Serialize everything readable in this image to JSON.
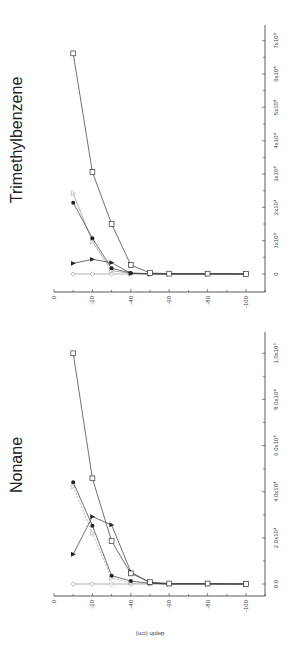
{
  "figure": {
    "orientation": "rotated 90 degrees counter-clockwise",
    "colors": {
      "axis": "#333333",
      "line_dark": "#333333",
      "line_gray": "#aaaaaa",
      "marker_fill": "#222222",
      "background": "#ffffff"
    }
  },
  "chart_data": [
    {
      "type": "line",
      "title": "Trimethylbenzene",
      "xlabel": "depth (cm)",
      "ylabel": "",
      "x": [
        -10,
        -20,
        -30,
        -40,
        -50,
        -60,
        -80,
        -100
      ],
      "xlim": [
        0,
        -110
      ],
      "ylim": [
        -5000,
        75000
      ],
      "x_ticks": [
        "0",
        "-20",
        "-40",
        "-60",
        "-80",
        "-100"
      ],
      "y_ticks": [
        "0",
        "1x10⁴",
        "2x10⁴",
        "3x10⁴",
        "4x10⁴",
        "5x10⁴",
        "6x10⁴",
        "7x10⁴"
      ],
      "y_tick_values": [
        0,
        10000,
        20000,
        30000,
        40000,
        50000,
        60000,
        70000
      ],
      "grid": false,
      "series": [
        {
          "name": "open square",
          "marker": "square-open",
          "style": "solid-dark",
          "values": [
            66200,
            30600,
            15000,
            2700,
            300,
            100,
            100,
            0
          ]
        },
        {
          "name": "filled circle",
          "marker": "circle-filled",
          "style": "solid-dark",
          "values": [
            21400,
            10700,
            1700,
            300,
            100,
            0,
            0,
            0
          ]
        },
        {
          "name": "open triangle",
          "marker": "triangle-open",
          "style": "solid-gray",
          "values": [
            24200,
            9700,
            1000,
            200,
            0,
            0,
            0,
            0
          ]
        },
        {
          "name": "filled triangle",
          "marker": "triangle-filled",
          "style": "solid-dark",
          "values": [
            3200,
            4400,
            3400,
            200,
            0,
            0,
            0,
            0
          ]
        },
        {
          "name": "open diamond",
          "marker": "diamond-open",
          "style": "solid-gray",
          "values": [
            0,
            0,
            0,
            0,
            0,
            0,
            0,
            0
          ]
        }
      ]
    },
    {
      "type": "line",
      "title": "Nonane",
      "xlabel": "depth (cm)",
      "ylabel": "",
      "x": [
        -10,
        -20,
        -30,
        -40,
        -50,
        -60,
        -80,
        -100
      ],
      "xlim": [
        0,
        -110
      ],
      "ylim": [
        -5000,
        108000
      ],
      "x_ticks": [
        "0",
        "-20",
        "-40",
        "-60",
        "-80",
        "-100"
      ],
      "y_ticks": [
        "0.0",
        "2.0x10⁴",
        "4.0x10⁴",
        "6.0x10⁴",
        "8.0x10⁴",
        "1.0x10⁵"
      ],
      "y_tick_values": [
        0,
        20000,
        40000,
        60000,
        80000,
        100000
      ],
      "grid": false,
      "series": [
        {
          "name": "open square",
          "marker": "square-open",
          "style": "solid-dark",
          "values": [
            100000,
            45800,
            18600,
            4600,
            800,
            200,
            200,
            0
          ]
        },
        {
          "name": "filled circle",
          "marker": "circle-filled",
          "style": "solid-dark",
          "values": [
            44100,
            25300,
            3600,
            1300,
            300,
            0,
            0,
            0
          ]
        },
        {
          "name": "open triangle",
          "marker": "triangle-open",
          "style": "dashed-gray",
          "values": [
            42200,
            22000,
            2500,
            500,
            100,
            0,
            0,
            0
          ]
        },
        {
          "name": "filled triangle",
          "marker": "triangle-filled",
          "style": "solid-dark",
          "values": [
            12900,
            29200,
            25600,
            5300,
            500,
            0,
            0,
            0
          ]
        },
        {
          "name": "open diamond",
          "marker": "diamond-open",
          "style": "solid-gray",
          "values": [
            0,
            0,
            0,
            0,
            0,
            0,
            0,
            0
          ]
        }
      ]
    }
  ]
}
